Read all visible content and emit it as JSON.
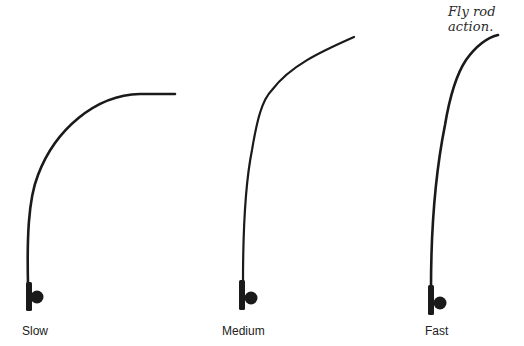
{
  "caption": "Fly rod action.",
  "rods": [
    {
      "id": "slow",
      "label": "Slow"
    },
    {
      "id": "medium",
      "label": "Medium"
    },
    {
      "id": "fast",
      "label": "Fast"
    }
  ],
  "colors": {
    "ink": "#1a1a1a",
    "background": "#ffffff"
  }
}
